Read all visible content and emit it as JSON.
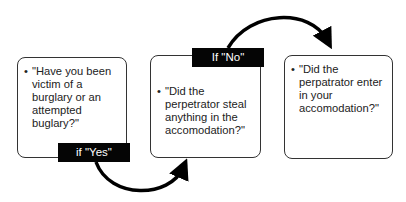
{
  "diagram": {
    "steps": [
      {
        "text": "\"Have you been victim of a burglary or an attempted buglary?\""
      },
      {
        "text": "\"Did the perpetrator steal anything in the accomodation?\""
      },
      {
        "text": "\"Did the perpatrator enter in your accomodation?\""
      }
    ],
    "transitions": [
      {
        "from": 0,
        "to": 1,
        "label": "if \"Yes\""
      },
      {
        "from": 1,
        "to": 2,
        "label": "If \"No\""
      }
    ],
    "bullet": "•"
  }
}
